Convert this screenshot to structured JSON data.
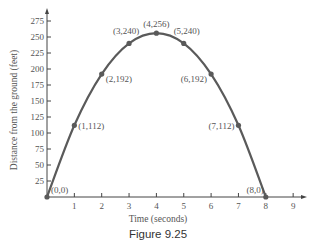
{
  "chart_data": {
    "type": "line",
    "title": "",
    "caption": "Figure 9.25",
    "xlabel": "Time (seconds)",
    "ylabel": "Distance from the ground (feet)",
    "xlim": [
      0,
      9
    ],
    "ylim": [
      0,
      275
    ],
    "x_ticks": [
      1,
      2,
      3,
      4,
      5,
      6,
      7,
      8,
      9
    ],
    "y_ticks": [
      25,
      50,
      75,
      100,
      125,
      150,
      175,
      200,
      225,
      250,
      275
    ],
    "grid": false,
    "legend": null,
    "series": [
      {
        "name": "Height",
        "x": [
          0,
          1,
          2,
          3,
          4,
          5,
          6,
          7,
          8
        ],
        "y": [
          0,
          112,
          192,
          240,
          256,
          240,
          192,
          112,
          0
        ]
      }
    ],
    "point_labels": [
      "(0,0)",
      "(1,112)",
      "(2,192)",
      "(3,240)",
      "(4,256)",
      "(5,240)",
      "(6,192)",
      "(7,112)",
      "(8,0)"
    ],
    "colors": {
      "curve": "#5a5a5a",
      "axis": "#444444",
      "text": "#555555"
    }
  }
}
